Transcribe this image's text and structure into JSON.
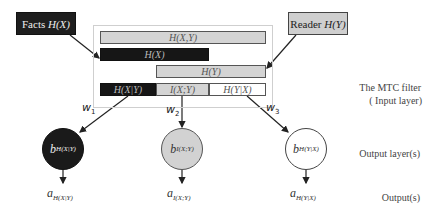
{
  "sources": {
    "facts": {
      "label": "Facts",
      "symbol": "H(X)"
    },
    "reader": {
      "label": "Reader",
      "symbol": "H(Y)"
    }
  },
  "filter_bars": {
    "joint": "H(X,Y)",
    "hx": "H(X)",
    "hy": "H(Y)",
    "cond_x_given_y": "H(X|Y)",
    "mutual": "I(X;Y)",
    "cond_y_given_x": "H(Y|X)"
  },
  "weights": [
    {
      "base": "w",
      "sub": "1"
    },
    {
      "base": "w",
      "sub": "2"
    },
    {
      "base": "w",
      "sub": "3"
    }
  ],
  "nodes": [
    {
      "base": "b",
      "sub": "H(X|Y)",
      "fill": "#1a1a1a"
    },
    {
      "base": "b",
      "sub": "I(X;Y)",
      "fill": "#d2d2d2"
    },
    {
      "base": "b",
      "sub": "H(Y|X)",
      "fill": "#ffffff"
    }
  ],
  "outputs": [
    {
      "base": "a",
      "sub": "H(X|Y)"
    },
    {
      "base": "a",
      "sub": "I(X;Y)"
    },
    {
      "base": "a",
      "sub": "H(Y|X)"
    }
  ],
  "side_labels": {
    "filter_line1": "The MTC filter",
    "filter_line2": "( Input layer)",
    "output_layers": "Output layer(s)",
    "outputs": "Output(s)"
  }
}
